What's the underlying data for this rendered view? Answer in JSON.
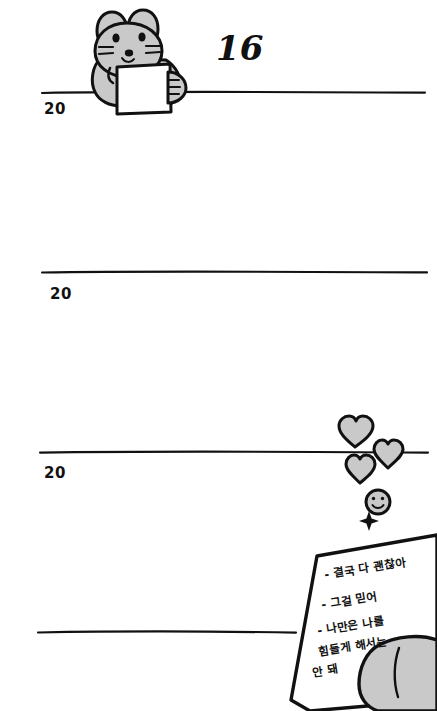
{
  "page": {
    "background_color": "#ffffff",
    "ink_color": "#111111",
    "fill_gray": "#c9c9c9"
  },
  "day_number": "16",
  "year_lines": [
    {
      "label": "20",
      "line_name": "entry-line-1"
    },
    {
      "label": "20",
      "line_name": "entry-line-2"
    },
    {
      "label": "20",
      "line_name": "entry-line-3"
    },
    {
      "label": "",
      "line_name": "entry-line-4"
    }
  ],
  "characters": {
    "rabbit": {
      "name": "rabbit-character",
      "description": "gray rabbit holding a sheet of paper",
      "fill": "#c9c9c9"
    },
    "hand": {
      "name": "hand-holding-note",
      "fill": "#c9c9c9"
    }
  },
  "doodles": {
    "hearts": [
      {
        "name": "heart-icon-1",
        "fill": "#c9c9c9"
      },
      {
        "name": "heart-icon-2",
        "fill": "#c9c9c9"
      },
      {
        "name": "heart-icon-3",
        "fill": "#c9c9c9"
      }
    ],
    "smiley": {
      "name": "smiley-face-icon",
      "fill": "#c9c9c9"
    },
    "sparkle": {
      "name": "sparkle-icon",
      "fill": "#111111"
    }
  },
  "note": {
    "name": "handwritten-note",
    "paper_color": "#ffffff",
    "lines": [
      "- 결국 다 괜찮아",
      "- 그걸 믿어",
      "- 나만은 나를",
      "힘들게 해서는",
      "안 돼"
    ]
  }
}
